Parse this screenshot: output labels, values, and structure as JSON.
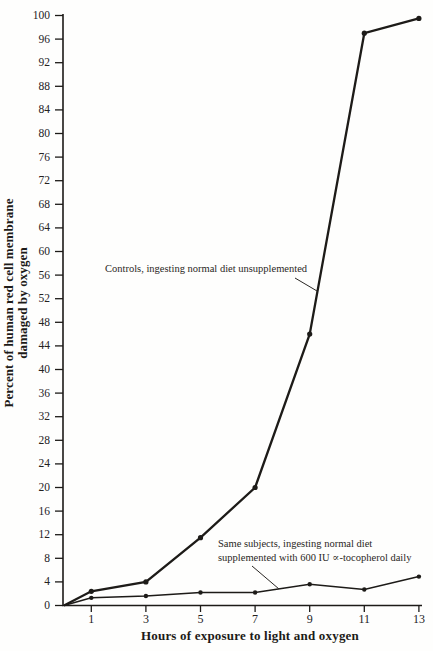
{
  "figure": {
    "background": "#fefefd",
    "ink": "#1d1b18"
  },
  "chart_data": {
    "type": "line",
    "title": "",
    "xlabel": "Hours of exposure to light and oxygen",
    "ylabel": "Percent of human red cell membrane\ndamaged by oxygen",
    "xlim": [
      0,
      13.2
    ],
    "ylim": [
      0,
      100
    ],
    "xticks": [
      1,
      3,
      5,
      7,
      9,
      11,
      13
    ],
    "yticks": [
      0,
      4,
      8,
      12,
      16,
      20,
      24,
      28,
      32,
      36,
      40,
      44,
      48,
      52,
      56,
      60,
      64,
      68,
      72,
      76,
      80,
      84,
      88,
      92,
      96,
      100
    ],
    "grid": false,
    "legend_position": "none - inline annotations with leader lines",
    "x": [
      0,
      1,
      3,
      5,
      7,
      9,
      11,
      13
    ],
    "series": [
      {
        "name": "controls",
        "label": "Controls, ingesting normal diet unsupplemented",
        "values": [
          0,
          2.4,
          4,
          11.5,
          20,
          46,
          97,
          99.5
        ]
      },
      {
        "name": "supplemented",
        "label": "Same subjects, ingesting normal diet supplemented with 600 IU ∝-tocopherol daily",
        "values": [
          0,
          1.3,
          1.6,
          2.2,
          2.2,
          3.6,
          2.7,
          4.9
        ]
      }
    ],
    "annotations": {
      "controls": {
        "text": "Controls, ingesting normal diet unsupplemented"
      },
      "supplemented": {
        "text": "Same subjects, ingesting normal diet\nsupplemented with 600 IU ∝-tocopherol daily"
      }
    },
    "ink_color": "#1d1b18"
  }
}
